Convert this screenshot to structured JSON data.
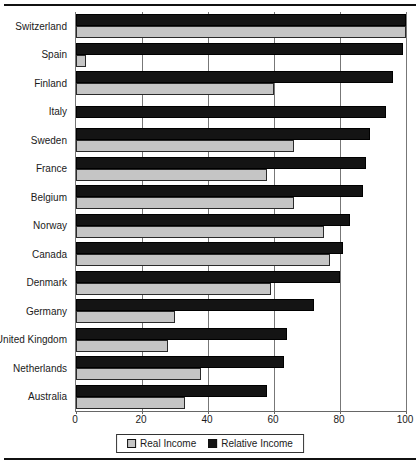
{
  "chart_data": {
    "type": "bar",
    "orientation": "horizontal",
    "title": "",
    "xlabel": "",
    "ylabel": "",
    "categories": [
      "Switzerland",
      "Spain",
      "Finland",
      "Italy",
      "Sweden",
      "France",
      "Belgium",
      "Norway",
      "Canada",
      "Denmark",
      "Germany",
      "United Kingdom",
      "Netherlands",
      "Australia"
    ],
    "series": [
      {
        "name": "Real Income",
        "color": "#c5c5c5",
        "values": [
          100,
          3,
          60,
          0,
          66,
          58,
          66,
          75,
          77,
          59,
          30,
          28,
          38,
          33
        ]
      },
      {
        "name": "Relative Income",
        "color": "#141414",
        "values": [
          100,
          99,
          96,
          94,
          89,
          88,
          87,
          83,
          81,
          80,
          72,
          64,
          63,
          58
        ]
      }
    ],
    "bar_order_within_group": [
      "Relative Income",
      "Real Income"
    ],
    "xlim": [
      0,
      100
    ],
    "xticks": [
      0,
      20,
      40,
      60,
      80,
      100
    ],
    "grid": true,
    "legend_position": "bottom-center"
  },
  "colors": {
    "background": "#ffffff",
    "bar_real": "#c5c5c5",
    "bar_relative": "#141414",
    "gridline": "#777777",
    "rule": "#111111",
    "text": "#1a1a1a"
  }
}
